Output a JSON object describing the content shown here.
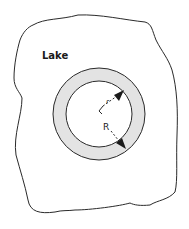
{
  "diagram": {
    "region_label": "Lake",
    "inner_radius_label": "r",
    "outer_radius_label": "R",
    "colors": {
      "stroke": "#2a2a2a",
      "ring_fill": "#e3e3e3",
      "background": "#ffffff"
    }
  }
}
